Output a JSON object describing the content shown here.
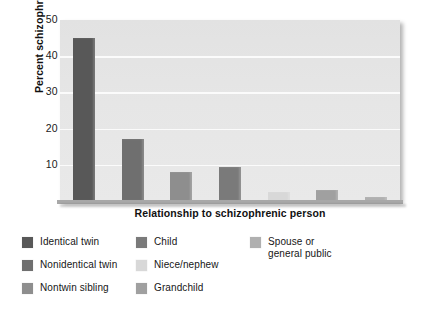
{
  "chart_data": {
    "type": "bar",
    "title": "",
    "xlabel": "Relationship to schizophrenic person",
    "ylabel": "Percent schizophrenic",
    "categories": [
      "Identical twin",
      "Nonidentical twin",
      "Nontwin sibling",
      "Child",
      "Niece/nephew",
      "Grandchild",
      "Spouse or general public"
    ],
    "values": [
      45,
      17,
      8,
      9.5,
      2.5,
      3,
      1
    ],
    "ylim": [
      0,
      50
    ],
    "yticks": [
      10,
      20,
      30,
      40,
      50
    ],
    "ytick_labels": [
      "10",
      "20",
      "30",
      "40",
      "50"
    ],
    "xticks_visible": false,
    "grid": "horizontal",
    "legend_position": "below",
    "bar_colors": [
      "#585858",
      "#6f6f6f",
      "#8e8e8e",
      "#7a7a7a",
      "#d8d8d8",
      "#a0a0a0",
      "#b0b0b0"
    ],
    "plot_background": "#e6e6e6",
    "gridline_color": "#fbfbfb"
  },
  "legend": {
    "columns": [
      [
        {
          "label": "Identical twin",
          "swatch": "#585858"
        },
        {
          "label": "Nonidentical twin",
          "swatch": "#6f6f6f"
        },
        {
          "label": "Nontwin sibling",
          "swatch": "#8e8e8e"
        }
      ],
      [
        {
          "label": "Child",
          "swatch": "#7a7a7a"
        },
        {
          "label": "Niece/nephew",
          "swatch": "#d8d8d8"
        },
        {
          "label": "Grandchild",
          "swatch": "#a0a0a0"
        }
      ],
      [
        {
          "label": "Spouse or\ngeneral public",
          "swatch": "#b0b0b0"
        }
      ]
    ]
  }
}
